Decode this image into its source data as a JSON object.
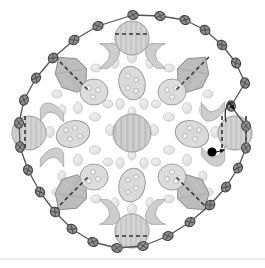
{
  "figure": {
    "title": "Radially symmetric cell cross-section schematic",
    "caption": "",
    "background_color": "#ffffff",
    "canvas": {
      "width": 265,
      "height": 268
    }
  },
  "palette": {
    "outline": "#4a4a4a",
    "boundary_line": "#555555",
    "node_fill": "#8d8d8d",
    "node_stroke": "#3c3c3c",
    "organelle_fill_light": "#e2e2e2",
    "organelle_fill_mid": "#d2d2d2",
    "organelle_fill_dark": "#b9b9b9",
    "organelle_stroke": "#9a9a9a",
    "marker_black": "#000000",
    "dashed_line": "#3a3a3a",
    "baseline_gray": "#d8dadd"
  },
  "annotation": {
    "marker_label": "black-dot-marker",
    "marker_x": 212,
    "marker_y": 152,
    "arrow_label": "callout-arrow",
    "arrow_x": 231,
    "arrow_y": 106,
    "pointer_note": ""
  },
  "boundary": {
    "name": "outer-contour",
    "node_count": 28,
    "node_shape": "lens",
    "nodes": [
      {
        "x": 133,
        "y": 15
      },
      {
        "x": 160,
        "y": 16
      },
      {
        "x": 185,
        "y": 20
      },
      {
        "x": 205,
        "y": 30
      },
      {
        "x": 222,
        "y": 45
      },
      {
        "x": 236,
        "y": 63
      },
      {
        "x": 245,
        "y": 83
      },
      {
        "x": 231,
        "y": 106
      },
      {
        "x": 246,
        "y": 126
      },
      {
        "x": 246,
        "y": 148
      },
      {
        "x": 238,
        "y": 168
      },
      {
        "x": 226,
        "y": 187
      },
      {
        "x": 210,
        "y": 205
      },
      {
        "x": 190,
        "y": 222
      },
      {
        "x": 168,
        "y": 236
      },
      {
        "x": 143,
        "y": 246
      },
      {
        "x": 117,
        "y": 248
      },
      {
        "x": 93,
        "y": 242
      },
      {
        "x": 72,
        "y": 229
      },
      {
        "x": 55,
        "y": 212
      },
      {
        "x": 40,
        "y": 192
      },
      {
        "x": 28,
        "y": 170
      },
      {
        "x": 20,
        "y": 147
      },
      {
        "x": 19,
        "y": 123
      },
      {
        "x": 24,
        "y": 100
      },
      {
        "x": 36,
        "y": 78
      },
      {
        "x": 53,
        "y": 58
      },
      {
        "x": 74,
        "y": 40
      },
      {
        "x": 98,
        "y": 26
      }
    ]
  },
  "organelles": {
    "center_nucleus": {
      "name": "central-nucleus",
      "cx": 132,
      "cy": 133,
      "r": 19,
      "striped": true
    },
    "cardinal_nuclei": [
      {
        "name": "nucleus-top",
        "cx": 132,
        "cy": 38,
        "r": 17,
        "dashed": true
      },
      {
        "name": "nucleus-bottom",
        "cx": 132,
        "cy": 231,
        "r": 17,
        "dashed": true
      },
      {
        "name": "nucleus-left",
        "cx": 29,
        "cy": 133,
        "r": 17,
        "dashed": true
      },
      {
        "name": "nucleus-right",
        "cx": 235,
        "cy": 133,
        "r": 17,
        "dashed": true
      }
    ],
    "diamonds": [
      {
        "name": "diamond-top-left",
        "cx": 71,
        "cy": 73
      },
      {
        "name": "diamond-top-right",
        "cx": 193,
        "cy": 73
      },
      {
        "name": "diamond-bottom-left",
        "cx": 71,
        "cy": 194
      },
      {
        "name": "diamond-bottom-right",
        "cx": 193,
        "cy": 194
      }
    ],
    "spotted_discs": [
      {
        "name": "spotted-disc-upper-left",
        "cx": 94,
        "cy": 92,
        "rx": 14,
        "ry": 13,
        "spots": 3
      },
      {
        "name": "spotted-disc-upper-right",
        "cx": 172,
        "cy": 92,
        "rx": 14,
        "ry": 13,
        "spots": 3
      },
      {
        "name": "spotted-disc-lower-left",
        "cx": 94,
        "cy": 177,
        "rx": 14,
        "ry": 13,
        "spots": 3
      },
      {
        "name": "spotted-disc-lower-right",
        "cx": 172,
        "cy": 177,
        "rx": 14,
        "ry": 13,
        "spots": 3
      },
      {
        "name": "spotted-oval-left",
        "cx": 73,
        "cy": 134,
        "rx": 17,
        "ry": 13,
        "spots": 4
      },
      {
        "name": "spotted-oval-right",
        "cx": 192,
        "cy": 134,
        "rx": 17,
        "ry": 13,
        "spots": 4
      },
      {
        "name": "spotted-oval-top",
        "cx": 132,
        "cy": 82,
        "rx": 13,
        "ry": 17,
        "spots": 4
      },
      {
        "name": "spotted-oval-bottom",
        "cx": 132,
        "cy": 185,
        "rx": 13,
        "ry": 17,
        "spots": 4
      }
    ],
    "wave_shapes": {
      "name": "s-curve-organelle",
      "count": 8,
      "positions": [
        {
          "cx": 110,
          "cy": 56,
          "rot": 0
        },
        {
          "cx": 155,
          "cy": 56,
          "rot": 0
        },
        {
          "cx": 110,
          "cy": 212,
          "rot": 180
        },
        {
          "cx": 155,
          "cy": 212,
          "rot": 180
        },
        {
          "cx": 52,
          "cy": 112,
          "rot": 270
        },
        {
          "cx": 52,
          "cy": 156,
          "rot": 270
        },
        {
          "cx": 213,
          "cy": 112,
          "rot": 90
        },
        {
          "cx": 213,
          "cy": 156,
          "rot": 90
        }
      ]
    },
    "small_vesicles": {
      "name": "vesicle",
      "count": 44,
      "fill": "#e4e4e4"
    }
  }
}
